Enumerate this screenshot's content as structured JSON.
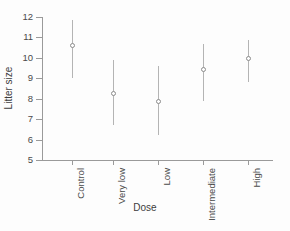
{
  "chart_data": {
    "type": "scatter",
    "title": "",
    "xlabel": "Dose",
    "ylabel": "Litter size",
    "categories": [
      "Control",
      "Very low",
      "Low",
      "Intermediate",
      "High"
    ],
    "values": [
      10.6,
      8.25,
      7.85,
      9.45,
      9.95
    ],
    "errors_low": [
      9.0,
      6.7,
      6.2,
      7.9,
      8.8
    ],
    "errors_high": [
      11.85,
      9.9,
      9.6,
      10.7,
      10.85
    ],
    "series": [
      {
        "name": "Litter size",
        "points": [
          {
            "category": "Control",
            "value": 10.6,
            "low": 9.0,
            "high": 11.85
          },
          {
            "category": "Very low",
            "value": 8.25,
            "low": 6.7,
            "high": 9.9
          },
          {
            "category": "Low",
            "value": 7.85,
            "low": 6.2,
            "high": 9.6
          },
          {
            "category": "Intermediate",
            "value": 9.45,
            "low": 7.9,
            "high": 10.7
          },
          {
            "category": "High",
            "value": 9.95,
            "low": 8.8,
            "high": 10.85
          }
        ]
      }
    ],
    "ylim": [
      5,
      12
    ],
    "yticks": [
      5,
      6,
      7,
      8,
      9,
      10,
      11,
      12
    ],
    "ytick_labels": [
      "5",
      "6",
      "7",
      "8",
      "9",
      "10",
      "11",
      "12"
    ],
    "grid": false,
    "legend": null,
    "marker_style": "open-circle",
    "colors": {
      "axis": "#9a9a9a",
      "marker_stroke": "#8c8c8c",
      "marker_fill": "#ffffff",
      "errorbar": "#b4b4b4",
      "text": "#4a4a4a",
      "background": "#fdfdfd"
    }
  }
}
